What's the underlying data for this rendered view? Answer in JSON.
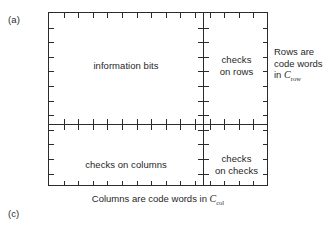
{
  "figure": {
    "panel_labels": {
      "top_left": "(a)",
      "bottom_left": "(c)"
    },
    "quadrants": {
      "information_bits": "information bits",
      "checks_on_rows": "checks\non rows",
      "checks_on_columns": "checks on columns",
      "checks_on_checks": "checks\non checks"
    },
    "row_caption": {
      "line1": "Rows are",
      "line2": "code words",
      "line3_prefix": "in ",
      "code_symbol": "C",
      "code_subscript": "row"
    },
    "column_caption": {
      "text_prefix": "Columns are code words in ",
      "code_symbol": "C",
      "code_subscript": "col"
    },
    "geometry": {
      "box_left": 48,
      "box_top": 12,
      "box_width": 220,
      "box_height": 174,
      "divider_x": 154,
      "divider_y": 111,
      "tick_spacing": 14.6,
      "tick_length": 5
    },
    "colors": {
      "line": "#2b2b2b",
      "text": "#1f1f1f",
      "background": "#ffffff"
    }
  }
}
